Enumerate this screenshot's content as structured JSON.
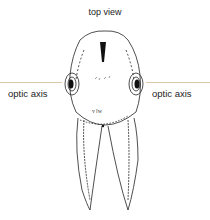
{
  "title": "top view",
  "axis": {
    "left_label": "optic axis",
    "right_label": "optic axis",
    "line_color": "#d9c9a8"
  },
  "figure": {
    "annotation": "vlw"
  }
}
